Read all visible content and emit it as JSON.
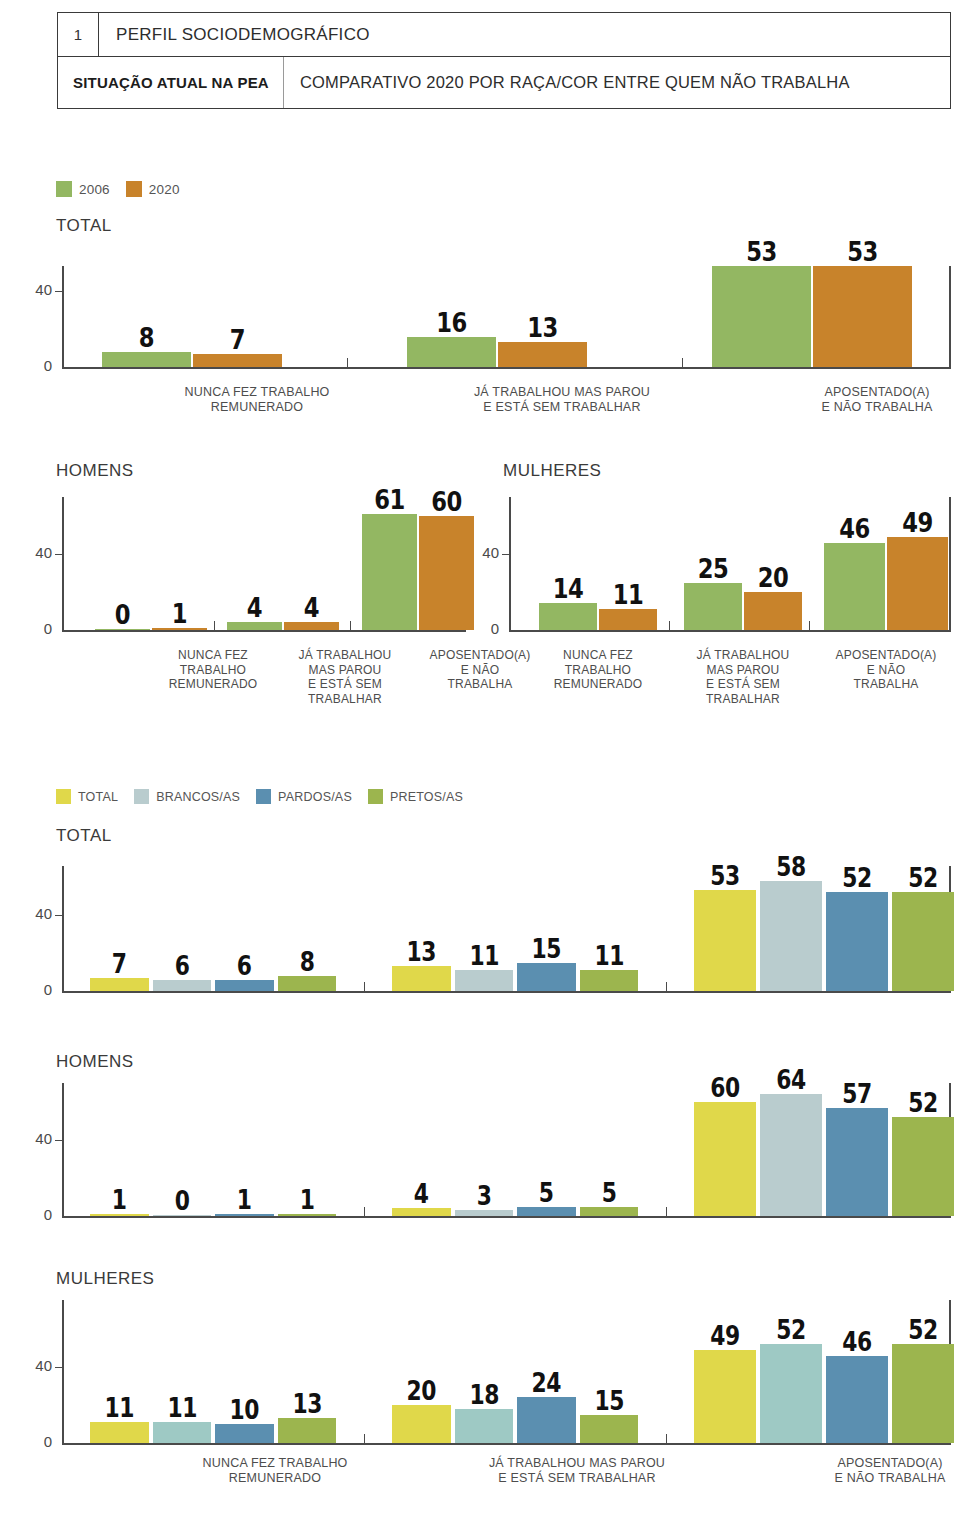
{
  "header": {
    "number": "1",
    "section": "PERFIL SOCIODEMOGRÁFICO",
    "tag": "SITUAÇÃO ATUAL NA PEA",
    "description": "COMPARATIVO 2020 POR RAÇA/COR ENTRE QUEM NÃO TRABALHA"
  },
  "legend_year": {
    "items": [
      {
        "label": "2006",
        "color": "#93b762"
      },
      {
        "label": "2020",
        "color": "#c8832b"
      }
    ]
  },
  "legend_race": {
    "items": [
      {
        "label": "TOTAL",
        "color": "#e0d84a"
      },
      {
        "label": "BRANCOS/AS",
        "color": "#b9ccce"
      },
      {
        "label": "PARDOS/AS",
        "color": "#5b8fb0"
      },
      {
        "label": "PRETOS/AS",
        "color": "#9cb54e"
      }
    ]
  },
  "panels": {
    "total_year": "TOTAL",
    "homens_year": "HOMENS",
    "mulheres_year": "MULHERES",
    "total_race": "TOTAL",
    "homens_race": "HOMENS",
    "mulheres_race": "MULHERES"
  },
  "axis": {
    "ticks": [
      "40",
      "0"
    ],
    "ymax": 70
  },
  "categories_long": [
    [
      "NUNCA FEZ TRABALHO",
      "REMUNERADO"
    ],
    [
      "JÁ TRABALHOU MAS PAROU",
      "E ESTÁ SEM TRABALHAR"
    ],
    [
      "APOSENTADO(A)",
      "E NÃO TRABALHA"
    ]
  ],
  "categories_short": [
    [
      "NUNCA FEZ",
      "TRABALHO",
      "REMUNERADO"
    ],
    [
      "JÁ TRABALHOU",
      "MAS PAROU",
      "E ESTÁ SEM",
      "TRABALHAR"
    ],
    [
      "APOSENTADO(A)",
      "E NÃO",
      "TRABALHA"
    ]
  ],
  "chart_data": [
    {
      "type": "bar",
      "title": "TOTAL",
      "subtitle": "Situação atual na PEA — comparativo 2006 x 2020",
      "xlabel": "",
      "ylabel": "",
      "ylim": [
        0,
        70
      ],
      "yticks": [
        0,
        40
      ],
      "grid": false,
      "legend_position": "top-left",
      "categories": [
        "NUNCA FEZ TRABALHO REMUNERADO",
        "JÁ TRABALHOU MAS PAROU E ESTÁ SEM TRABALHAR",
        "APOSENTADO(A) E NÃO TRABALHA"
      ],
      "series": [
        {
          "name": "2006",
          "color": "#93b762",
          "values": [
            8,
            16,
            53
          ]
        },
        {
          "name": "2020",
          "color": "#c8832b",
          "values": [
            7,
            13,
            53
          ]
        }
      ]
    },
    {
      "type": "bar",
      "title": "HOMENS",
      "subtitle": "Situação atual na PEA — comparativo 2006 x 2020",
      "xlabel": "",
      "ylabel": "",
      "ylim": [
        0,
        70
      ],
      "yticks": [
        0,
        40
      ],
      "grid": false,
      "legend_position": "shared",
      "categories": [
        "NUNCA FEZ TRABALHO REMUNERADO",
        "JÁ TRABALHOU MAS PAROU E ESTÁ SEM TRABALHAR",
        "APOSENTADO(A) E NÃO TRABALHA"
      ],
      "series": [
        {
          "name": "2006",
          "color": "#93b762",
          "values": [
            0,
            4,
            61
          ]
        },
        {
          "name": "2020",
          "color": "#c8832b",
          "values": [
            1,
            4,
            60
          ]
        }
      ]
    },
    {
      "type": "bar",
      "title": "MULHERES",
      "subtitle": "Situação atual na PEA — comparativo 2006 x 2020",
      "xlabel": "",
      "ylabel": "",
      "ylim": [
        0,
        70
      ],
      "yticks": [
        0,
        40
      ],
      "grid": false,
      "legend_position": "shared",
      "categories": [
        "NUNCA FEZ TRABALHO REMUNERADO",
        "JÁ TRABALHOU MAS PAROU E ESTÁ SEM TRABALHAR",
        "APOSENTADO(A) E NÃO TRABALHA"
      ],
      "series": [
        {
          "name": "2006",
          "color": "#93b762",
          "values": [
            14,
            25,
            46
          ]
        },
        {
          "name": "2020",
          "color": "#c8832b",
          "values": [
            11,
            20,
            49
          ]
        }
      ]
    },
    {
      "type": "bar",
      "title": "TOTAL",
      "subtitle": "Comparativo 2020 por raça/cor entre quem não trabalha",
      "xlabel": "",
      "ylabel": "",
      "ylim": [
        0,
        70
      ],
      "yticks": [
        0,
        40
      ],
      "grid": false,
      "legend_position": "top-left",
      "categories": [
        "NUNCA FEZ TRABALHO REMUNERADO",
        "JÁ TRABALHOU MAS PAROU E ESTÁ SEM TRABALHAR",
        "APOSENTADO(A) E NÃO TRABALHA"
      ],
      "series": [
        {
          "name": "TOTAL",
          "color": "#e0d84a",
          "values": [
            7,
            13,
            53
          ]
        },
        {
          "name": "BRANCOS/AS",
          "color": "#b9ccce",
          "values": [
            6,
            11,
            58
          ]
        },
        {
          "name": "PARDOS/AS",
          "color": "#5b8fb0",
          "values": [
            6,
            15,
            52
          ]
        },
        {
          "name": "PRETOS/AS",
          "color": "#9cb54e",
          "values": [
            8,
            11,
            52
          ]
        }
      ]
    },
    {
      "type": "bar",
      "title": "HOMENS",
      "subtitle": "Comparativo 2020 por raça/cor entre quem não trabalha",
      "xlabel": "",
      "ylabel": "",
      "ylim": [
        0,
        70
      ],
      "yticks": [
        0,
        40
      ],
      "grid": false,
      "legend_position": "shared",
      "categories": [
        "NUNCA FEZ TRABALHO REMUNERADO",
        "JÁ TRABALHOU MAS PAROU E ESTÁ SEM TRABALHAR",
        "APOSENTADO(A) E NÃO TRABALHA"
      ],
      "series": [
        {
          "name": "TOTAL",
          "color": "#e0d84a",
          "values": [
            1,
            4,
            60
          ]
        },
        {
          "name": "BRANCOS/AS",
          "color": "#b9ccce",
          "values": [
            0,
            3,
            64
          ]
        },
        {
          "name": "PARDOS/AS",
          "color": "#5b8fb0",
          "values": [
            1,
            5,
            57
          ]
        },
        {
          "name": "PRETOS/AS",
          "color": "#9cb54e",
          "values": [
            1,
            5,
            52
          ]
        }
      ]
    },
    {
      "type": "bar",
      "title": "MULHERES",
      "subtitle": "Comparativo 2020 por raça/cor entre quem não trabalha",
      "xlabel": "",
      "ylabel": "",
      "ylim": [
        0,
        70
      ],
      "yticks": [
        0,
        40
      ],
      "grid": false,
      "legend_position": "shared",
      "categories": [
        "NUNCA FEZ TRABALHO REMUNERADO",
        "JÁ TRABALHOU MAS PAROU E ESTÁ SEM TRABALHAR",
        "APOSENTADO(A) E NÃO TRABALHA"
      ],
      "series": [
        {
          "name": "TOTAL",
          "color": "#e0d84a",
          "values": [
            11,
            20,
            49
          ]
        },
        {
          "name": "BRANCOS/AS",
          "color": "#9ec9c4",
          "values": [
            11,
            18,
            52
          ]
        },
        {
          "name": "PARDOS/AS",
          "color": "#5b8fb0",
          "values": [
            10,
            24,
            46
          ]
        },
        {
          "name": "PRETOS/AS",
          "color": "#9cb54e",
          "values": [
            13,
            15,
            52
          ]
        }
      ]
    }
  ]
}
